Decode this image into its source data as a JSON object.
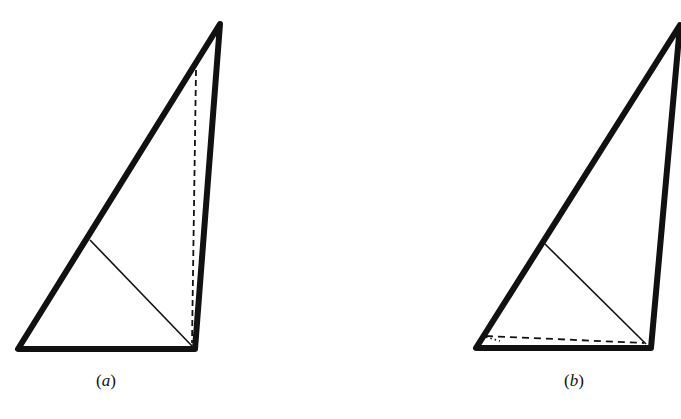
{
  "figures": [
    {
      "id": "a",
      "label": "(a)",
      "label_letter": "a",
      "triangle": {
        "A": [
          18,
          349
        ],
        "B": [
          195,
          349
        ],
        "C": [
          220,
          24
        ]
      },
      "perpendicular_solid": {
        "from": [
          90,
          240
        ],
        "to": [
          192,
          346
        ]
      },
      "altitude_dashed": {
        "from": [
          196,
          70
        ],
        "to": [
          192,
          343
        ],
        "orientation": "vertical"
      }
    },
    {
      "id": "b",
      "label": "(b)",
      "label_letter": "b",
      "triangle": {
        "A": [
          476,
          348
        ],
        "B": [
          651,
          348
        ],
        "C": [
          680,
          25
        ]
      },
      "perpendicular_solid": {
        "from": [
          545,
          244
        ],
        "to": [
          646,
          344
        ]
      },
      "altitude_dashed": {
        "from": [
          486,
          336
        ],
        "to": [
          644,
          343
        ],
        "orientation": "near-horizontal"
      }
    }
  ],
  "style": {
    "stroke_color": "#111111",
    "thick_width": 6,
    "thin_width": 1.6,
    "background": "#ffffff"
  }
}
